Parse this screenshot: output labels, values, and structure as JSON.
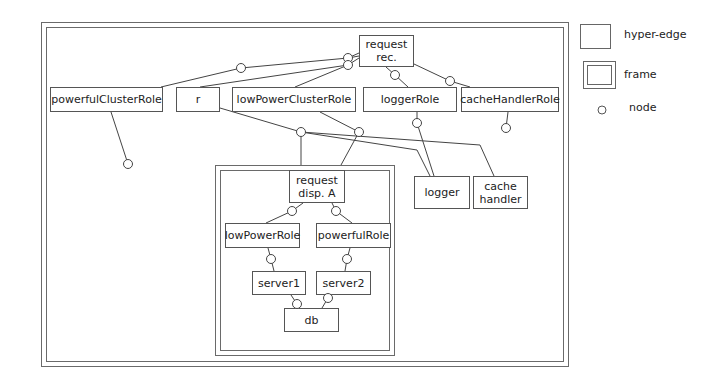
{
  "legend": {
    "hyper_edge": "hyper-edge",
    "frame": "frame",
    "node": "node"
  },
  "frames": [
    {
      "id": "outer-frame",
      "x": 41,
      "y": 22,
      "w": 528,
      "h": 345
    },
    {
      "id": "dispatch-frame",
      "x": 215,
      "y": 165,
      "w": 180,
      "h": 191
    }
  ],
  "hyper_edges": [
    {
      "id": "request-rec",
      "label": "request\nrec.",
      "x": 359,
      "y": 35,
      "w": 55,
      "h": 32
    },
    {
      "id": "powerfulClusterRole",
      "label": "powerfulClusterRole",
      "x": 50,
      "y": 87,
      "w": 113,
      "h": 25
    },
    {
      "id": "r",
      "label": "r",
      "x": 176,
      "y": 87,
      "w": 44,
      "h": 25
    },
    {
      "id": "lowPowerClusterRole",
      "label": "lowPowerClusterRole",
      "x": 232,
      "y": 87,
      "w": 124,
      "h": 25
    },
    {
      "id": "loggerRole",
      "label": "loggerRole",
      "x": 363,
      "y": 87,
      "w": 94,
      "h": 25
    },
    {
      "id": "cacheHandlerRole",
      "label": "cacheHandlerRole",
      "x": 461,
      "y": 87,
      "w": 98,
      "h": 25
    },
    {
      "id": "logger",
      "label": "logger",
      "x": 414,
      "y": 176,
      "w": 56,
      "h": 33
    },
    {
      "id": "cache-handler",
      "label": "cache\nhandler",
      "x": 473,
      "y": 176,
      "w": 55,
      "h": 33
    },
    {
      "id": "request-disp-a",
      "label": "request\ndisp. A",
      "x": 289,
      "y": 170,
      "w": 56,
      "h": 33
    },
    {
      "id": "lowPowerRole",
      "label": "lowPowerRole",
      "x": 225,
      "y": 223,
      "w": 75,
      "h": 25
    },
    {
      "id": "powerfulRole",
      "label": "powerfulRole",
      "x": 316,
      "y": 223,
      "w": 75,
      "h": 25
    },
    {
      "id": "server1",
      "label": "server1",
      "x": 252,
      "y": 271,
      "w": 54,
      "h": 24
    },
    {
      "id": "server2",
      "label": "server2",
      "x": 316,
      "y": 271,
      "w": 55,
      "h": 24
    },
    {
      "id": "db",
      "label": "db",
      "x": 284,
      "y": 308,
      "w": 55,
      "h": 24
    }
  ],
  "nodes": [
    {
      "id": "n1",
      "x": 241,
      "y": 68
    },
    {
      "id": "n2",
      "x": 348,
      "y": 58
    },
    {
      "id": "n3",
      "x": 348,
      "y": 65
    },
    {
      "id": "n4",
      "x": 395,
      "y": 75
    },
    {
      "id": "n5",
      "x": 450,
      "y": 81
    },
    {
      "id": "n6",
      "x": 128,
      "y": 164
    },
    {
      "id": "n7",
      "x": 301,
      "y": 132
    },
    {
      "id": "n8",
      "x": 359,
      "y": 132
    },
    {
      "id": "n9",
      "x": 417,
      "y": 123
    },
    {
      "id": "n10",
      "x": 506,
      "y": 128
    },
    {
      "id": "n11",
      "x": 292,
      "y": 211
    },
    {
      "id": "n12",
      "x": 336,
      "y": 211
    },
    {
      "id": "n13",
      "x": 271,
      "y": 259
    },
    {
      "id": "n14",
      "x": 347,
      "y": 259
    },
    {
      "id": "n15",
      "x": 297,
      "y": 304
    },
    {
      "id": "n16",
      "x": 328,
      "y": 298
    }
  ],
  "edges": [
    [
      359,
      56,
      348,
      58
    ],
    [
      348,
      58,
      241,
      68
    ],
    [
      241,
      68,
      161,
      87
    ],
    [
      359,
      58,
      348,
      65
    ],
    [
      348,
      65,
      200,
      87
    ],
    [
      348,
      65,
      295,
      87
    ],
    [
      359,
      53,
      348,
      58
    ],
    [
      386,
      67,
      395,
      75
    ],
    [
      395,
      75,
      408,
      87
    ],
    [
      414,
      64,
      450,
      81
    ],
    [
      450,
      81,
      470,
      87
    ],
    [
      111,
      112,
      128,
      164
    ],
    [
      220,
      108,
      301,
      132
    ],
    [
      301,
      132,
      417,
      150
    ],
    [
      417,
      150,
      430,
      176
    ],
    [
      301,
      132,
      480,
      145
    ],
    [
      480,
      145,
      494,
      176
    ],
    [
      301,
      132,
      301,
      165
    ],
    [
      320,
      112,
      359,
      132
    ],
    [
      359,
      132,
      341,
      165
    ],
    [
      417,
      112,
      417,
      123
    ],
    [
      417,
      123,
      434,
      176
    ],
    [
      508,
      112,
      506,
      128
    ],
    [
      303,
      203,
      292,
      211
    ],
    [
      292,
      211,
      266,
      223
    ],
    [
      332,
      203,
      336,
      211
    ],
    [
      336,
      211,
      352,
      223
    ],
    [
      268,
      248,
      271,
      259
    ],
    [
      271,
      259,
      274,
      271
    ],
    [
      350,
      248,
      347,
      259
    ],
    [
      347,
      259,
      345,
      271
    ],
    [
      291,
      295,
      297,
      304
    ],
    [
      297,
      304,
      299,
      308
    ],
    [
      328,
      298,
      322,
      308
    ]
  ]
}
